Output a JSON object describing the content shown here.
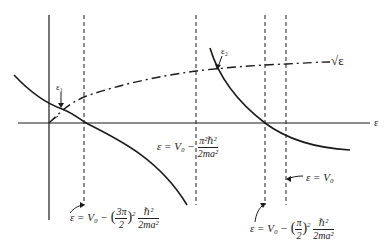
{
  "diagram": {
    "axis_label_x": "ε",
    "curve_sqrt_label": "√ε",
    "intersection_labels": [
      "ε₁",
      "ε₂"
    ],
    "equations": {
      "eq_3pi": {
        "lhs": "ε = V₀ −",
        "paren_open": "(",
        "num": "3π",
        "den": "2",
        "paren_close": ")",
        "exp": "2",
        "frac_num": "ℏ²",
        "frac_den": "2ma²"
      },
      "eq_pi2": {
        "lhs": "ε = V₀ −",
        "frac_num": "π²ℏ²",
        "frac_den": "2ma²"
      },
      "eq_v0": {
        "text": "ε = V₀"
      },
      "eq_pi_half": {
        "lhs": "ε = V₀ −",
        "paren_open": "(",
        "num": "π",
        "den": "2",
        "paren_close": ")",
        "exp": "2",
        "frac_num": "ℏ²",
        "frac_den": "2ma²"
      }
    },
    "line_color": "#1a1a1a"
  }
}
